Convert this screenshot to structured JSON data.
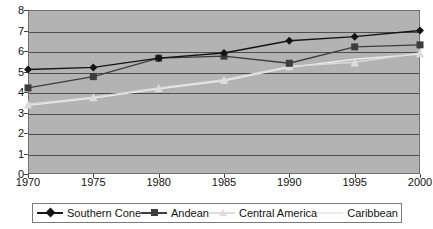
{
  "chart_data": {
    "type": "line",
    "title": "",
    "xlabel": "",
    "ylabel": "",
    "x": [
      1970,
      1975,
      1980,
      1985,
      1990,
      1995,
      2000
    ],
    "categories": [
      "1970",
      "1975",
      "1980",
      "1985",
      "1990",
      "1995",
      "2000"
    ],
    "ylim": [
      0,
      8
    ],
    "yticks": [
      0,
      1,
      2,
      3,
      4,
      5,
      6,
      7,
      8
    ],
    "ytick_labels": [
      "0",
      "1",
      "2",
      "3",
      "4",
      "5",
      "6",
      "7",
      "8"
    ],
    "grid": true,
    "grid_axis": "y",
    "legend_position": "bottom",
    "plot_background": "#b3b3b3",
    "series": [
      {
        "name": "Southern Cone",
        "marker": "diamond",
        "color": "#141414",
        "values": [
          5.1,
          5.2,
          5.65,
          5.9,
          6.5,
          6.7,
          7.0
        ]
      },
      {
        "name": "Andean",
        "marker": "square",
        "color": "#3d3d3d",
        "values": [
          4.2,
          4.75,
          5.65,
          5.75,
          5.4,
          6.2,
          6.3
        ]
      },
      {
        "name": "Central America",
        "marker": "triangle",
        "color": "#dcdcdc",
        "values": [
          3.4,
          3.75,
          4.2,
          4.6,
          5.25,
          5.45,
          5.9
        ]
      },
      {
        "name": "Caribbean",
        "marker": "none",
        "color": "#ededed",
        "values": [
          3.35,
          3.7,
          4.15,
          4.55,
          5.2,
          5.6,
          5.85
        ]
      }
    ]
  },
  "legend": {
    "entries": [
      {
        "label": "Southern Cone"
      },
      {
        "label": "Andean"
      },
      {
        "label": "Central America"
      },
      {
        "label": "Caribbean"
      }
    ]
  }
}
